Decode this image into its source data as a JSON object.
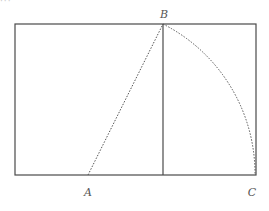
{
  "diagram": {
    "caption_fragment": "···",
    "colors": {
      "stroke": "#4a4a4a",
      "dotted": "#555555",
      "label": "#555555",
      "background": "#ffffff"
    },
    "rectangle": {
      "x": 15,
      "y": 24,
      "width": 241,
      "height": 151
    },
    "divider": {
      "x": 163,
      "y1": 24,
      "y2": 175
    },
    "points": {
      "A": {
        "label": "A",
        "x": 88,
        "y": 175
      },
      "B": {
        "label": "B",
        "x": 163,
        "y": 24
      },
      "C": {
        "label": "C",
        "x": 255,
        "y": 175
      }
    },
    "segments": [
      {
        "from": "A",
        "to": "B",
        "style": "dotted"
      }
    ],
    "arcs": [
      {
        "center": "A",
        "from": "B",
        "to": "C",
        "radius": 168,
        "style": "dotted"
      }
    ],
    "labels": {
      "A": "A",
      "B": "B",
      "C": "C"
    }
  }
}
